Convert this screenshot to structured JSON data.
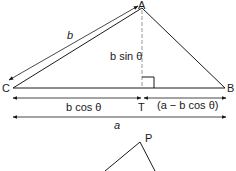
{
  "diagram": {
    "vertices": {
      "A": {
        "label": "A",
        "x": 142,
        "y": 8
      },
      "B": {
        "label": "B",
        "x": 225,
        "y": 88
      },
      "C": {
        "label": "C",
        "x": 13,
        "y": 88
      },
      "T": {
        "label": "T",
        "x": 142,
        "y": 88
      },
      "P": {
        "label": "P",
        "x": 140,
        "y": 142
      }
    },
    "labels": {
      "side_b": "b",
      "height": "b sin θ",
      "base_left": "b cos θ",
      "base_right": "(a − b cos θ)",
      "base_total": "a"
    },
    "colors": {
      "stroke": "#1a1a1a",
      "dashed": "#9a9a9a",
      "background": "#ffffff"
    }
  }
}
